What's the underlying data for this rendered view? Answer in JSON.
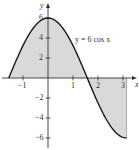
{
  "chart_data": {
    "type": "area",
    "title": "",
    "function_label": "y = 6 cos x",
    "xlabel": "x",
    "ylabel": "y",
    "xlim": [
      -1.6,
      3.6
    ],
    "ylim": [
      -7,
      7
    ],
    "x_ticks": [
      -1,
      1,
      2,
      3
    ],
    "x_tick_labels": [
      "−1",
      "1",
      "2",
      "3"
    ],
    "y_ticks": [
      6,
      4,
      2,
      -2,
      -4,
      -6
    ],
    "y_tick_labels": [
      "6",
      "4",
      "2",
      "−2",
      "−4",
      "−6"
    ],
    "grid": false,
    "domain": [
      -1.5708,
      3.1416
    ],
    "shaded": "region between curve and x-axis from x = −π/2 to x = π",
    "series": [
      {
        "name": "y = 6 cos x",
        "x": [
          -1.5708,
          -1.0,
          -0.5,
          0,
          0.5,
          1.0,
          1.5708,
          2.0,
          2.5,
          3.0,
          3.1416
        ],
        "y": [
          0,
          3.24,
          5.27,
          6,
          5.27,
          3.24,
          0,
          -2.5,
          -4.81,
          -5.94,
          -6
        ]
      }
    ],
    "colors": {
      "curve": "#1a1a1a",
      "fill": "#d9d9d9",
      "axes": "#333333"
    }
  }
}
